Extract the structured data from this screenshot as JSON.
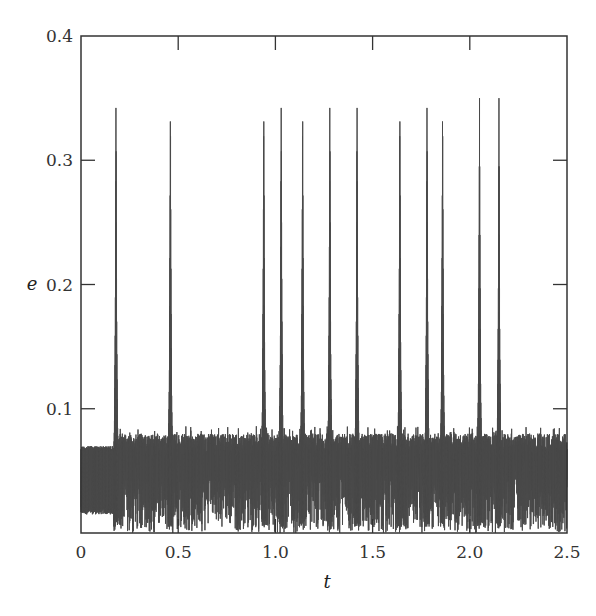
{
  "chart_data": {
    "type": "line",
    "title": "",
    "xlabel": "t",
    "ylabel": "e",
    "xlim": [
      0,
      2.5
    ],
    "ylim": [
      0,
      0.4
    ],
    "xticks": [
      0,
      0.5,
      1.0,
      1.5,
      2.0,
      2.5
    ],
    "xtick_labels": [
      "0",
      "0.5",
      "1.0",
      "1.5",
      "2.0",
      "2.5"
    ],
    "yticks": [
      0.1,
      0.2,
      0.3,
      0.4
    ],
    "ytick_labels": [
      "0.1",
      "0.2",
      "0.3",
      "0.4"
    ],
    "grid": false,
    "legend": null,
    "line_color": "#4a4a4a",
    "series": [
      {
        "name": "e(t)",
        "description": "Rapidly oscillating eccentricity with chaotic noise band roughly 0.0-0.085 and sharp spikes reaching ~0.35",
        "initial_band": {
          "t_range": [
            0,
            0.18
          ],
          "e_min": 0.015,
          "e_max": 0.07
        },
        "noise_band": {
          "e_min": 0.0,
          "e_max_typical": 0.08
        },
        "spikes": [
          {
            "t": 0.18,
            "e": 0.35
          },
          {
            "t": 0.46,
            "e": 0.35
          },
          {
            "t": 0.94,
            "e": 0.35
          },
          {
            "t": 1.03,
            "e": 0.35
          },
          {
            "t": 1.14,
            "e": 0.35
          },
          {
            "t": 1.28,
            "e": 0.35
          },
          {
            "t": 1.42,
            "e": 0.35
          },
          {
            "t": 1.64,
            "e": 0.35
          },
          {
            "t": 1.78,
            "e": 0.35
          },
          {
            "t": 1.86,
            "e": 0.35
          },
          {
            "t": 2.05,
            "e": 0.35
          },
          {
            "t": 2.15,
            "e": 0.35
          }
        ]
      }
    ]
  }
}
